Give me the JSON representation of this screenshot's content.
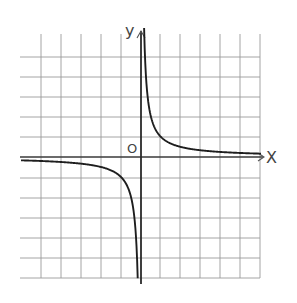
{
  "chart_data": {
    "type": "line",
    "title": "",
    "function": "y = 1/x",
    "xlabel": "X",
    "ylabel": "y",
    "origin_label": "O",
    "grid": true,
    "grid_unit_px": 20,
    "xlim": [
      -6,
      6
    ],
    "ylim": [
      -6,
      6
    ],
    "series": [
      {
        "name": "branch-positive-x",
        "x": [
          0.15,
          0.25,
          0.5,
          1,
          2,
          3,
          4,
          5,
          6
        ],
        "y": [
          6.0,
          4.0,
          2.0,
          1.0,
          0.5,
          0.33,
          0.25,
          0.2,
          0.17
        ]
      },
      {
        "name": "branch-negative-x",
        "x": [
          -6,
          -5,
          -4,
          -3,
          -2,
          -1,
          -0.5,
          -0.25,
          -0.15
        ],
        "y": [
          -0.17,
          -0.2,
          -0.25,
          -0.33,
          -0.5,
          -1.0,
          -2.0,
          -4.0,
          -6.0
        ]
      }
    ],
    "colors": {
      "grid": "#9a9a9a",
      "axis": "#3a3a3a",
      "curve": "#1e1e1e",
      "labels": "#444444"
    }
  },
  "caption": ""
}
